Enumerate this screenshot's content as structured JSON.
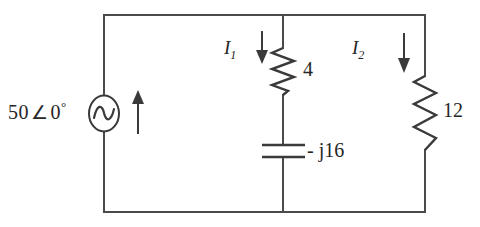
{
  "figure": {
    "type": "ac-circuit-schematic",
    "background_color": "#ffffff",
    "line_color": "#4a4a4a",
    "text_color": "#262626"
  },
  "source": {
    "name": "ac-voltage-source",
    "magnitude": "50",
    "angle_symbol": "∠",
    "phase": "0",
    "degree_symbol": "°",
    "label_full": "50 ∠ 0°",
    "symbol": "ac-source-sine-circle",
    "current_arrow_direction": "up"
  },
  "branches": [
    {
      "name": "middle-branch",
      "current_label": "I",
      "current_subscript": "1",
      "current_arrow_direction": "down",
      "components": [
        {
          "name": "resistor-4",
          "symbol": "resistor-zigzag",
          "value": "4"
        },
        {
          "name": "capacitor-j16",
          "symbol": "capacitor-plates",
          "value": "- j16"
        }
      ]
    },
    {
      "name": "right-branch",
      "current_label": "I",
      "current_subscript": "2",
      "current_arrow_direction": "down",
      "components": [
        {
          "name": "resistor-12",
          "symbol": "resistor-zigzag",
          "value": "12"
        }
      ]
    }
  ],
  "labels": {
    "source": "50",
    "angle": "∠",
    "phase_deg": "0",
    "degree": "°",
    "i_letter": "I",
    "i1_sub": "1",
    "i2_sub": "2",
    "resistor_4": "4",
    "resistor_12": "12",
    "capacitor": "- j16"
  }
}
